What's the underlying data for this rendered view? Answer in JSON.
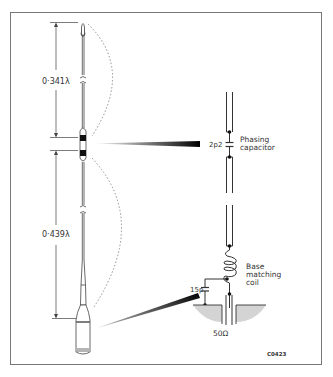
{
  "diagram": {
    "type": "antenna-schematic",
    "dimensions": {
      "upper_section": "0·341λ",
      "lower_section": "0·439λ"
    },
    "components": {
      "phasing_capacitor": {
        "value": "2p2",
        "label_line1": "Phasing",
        "label_line2": "capacitor"
      },
      "base_coil": {
        "label_line1": "Base",
        "label_line2": "matching",
        "label_line3": "coil"
      },
      "base_capacitor": {
        "value": "15p"
      },
      "feed_impedance": "50Ω"
    },
    "figure_code": "C0423",
    "colors": {
      "line": "#333333",
      "frame": "#666666",
      "ground_fill": "#d4d4d4"
    }
  }
}
